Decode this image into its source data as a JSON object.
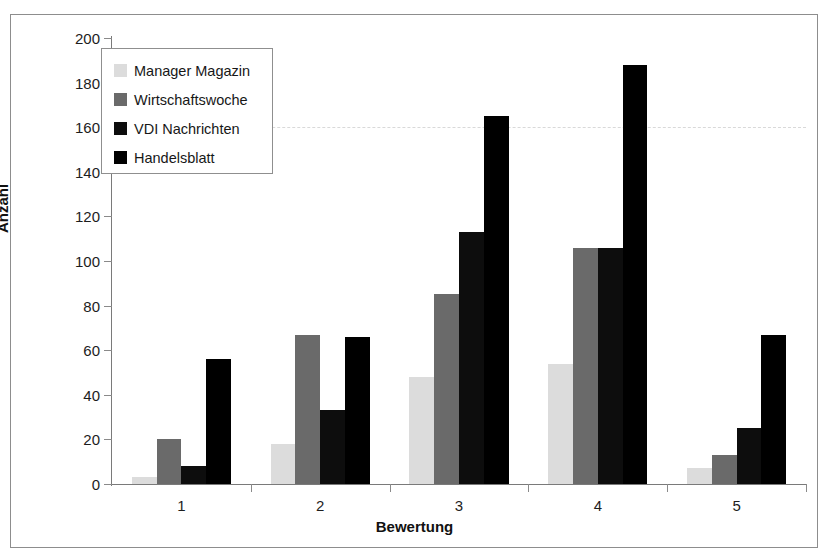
{
  "chart_data": {
    "type": "bar",
    "title": "",
    "xlabel": "Bewertung",
    "ylabel": "Anzahl",
    "categories": [
      "1",
      "2",
      "3",
      "4",
      "5"
    ],
    "ylim": [
      0,
      200
    ],
    "yticks": [
      0,
      20,
      40,
      60,
      80,
      100,
      120,
      140,
      160,
      180,
      200
    ],
    "grid": true,
    "gridlines": [
      160
    ],
    "legend_position": "top-left",
    "series": [
      {
        "name": "Manager Magazin",
        "color": "#dcdcdc",
        "values": [
          3,
          18,
          48,
          54,
          7
        ]
      },
      {
        "name": "Wirtschaftswoche",
        "color": "#6a6a6a",
        "values": [
          20,
          67,
          85,
          106,
          13
        ]
      },
      {
        "name": "VDI Nachrichten",
        "color": "#0d0d0d",
        "values": [
          8,
          33,
          113,
          106,
          25
        ]
      },
      {
        "name": "Handelsblatt",
        "color": "#000000",
        "values": [
          56,
          66,
          165,
          188,
          67
        ]
      }
    ]
  },
  "axis": {
    "y_tick_labels": [
      "200",
      "180",
      "160",
      "140",
      "120",
      "100",
      "80",
      "60",
      "40",
      "20",
      "0"
    ],
    "x_tick_labels": [
      "1",
      "2",
      "3",
      "4",
      "5"
    ],
    "y_axis_title": "Anzahl",
    "x_axis_title": "Bewertung"
  },
  "legend": {
    "items": [
      {
        "label": "Manager Magazin",
        "swatch": "#dcdcdc"
      },
      {
        "label": "Wirtschaftswoche",
        "swatch": "#6a6a6a"
      },
      {
        "label": "VDI Nachrichten",
        "swatch": "#0d0d0d"
      },
      {
        "label": "Handelsblatt",
        "swatch": "#000000"
      }
    ]
  }
}
